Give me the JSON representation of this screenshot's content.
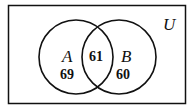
{
  "diagram": {
    "type": "venn",
    "universe_label": "U",
    "sets": [
      {
        "name": "A",
        "only_count": "69"
      },
      {
        "name": "B",
        "only_count": "60"
      }
    ],
    "intersection_count": "61",
    "colors": {
      "stroke": "#111111",
      "background": "#ffffff"
    }
  }
}
